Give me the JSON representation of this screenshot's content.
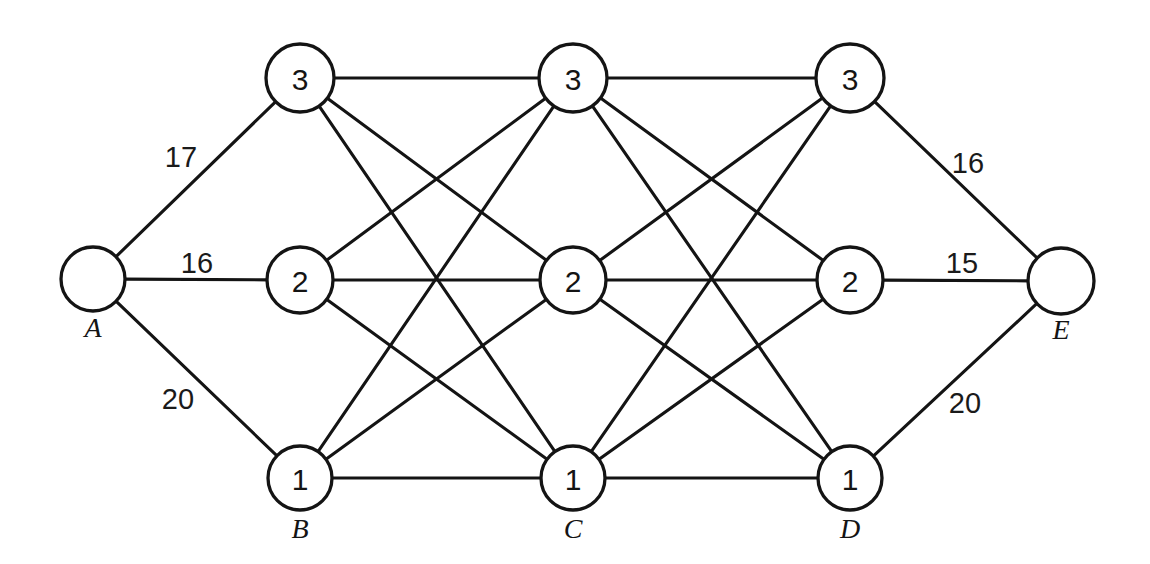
{
  "diagram": {
    "type": "node-link-diagram",
    "background_color": "#ffffff",
    "line_color": "#141414",
    "node_fill": "#ffffff",
    "width": 1150,
    "height": 564
  },
  "nodes": [
    {
      "id": "A",
      "name_label": "A",
      "value_label": "",
      "cx": 93,
      "cy": 279,
      "r": 32,
      "name_dx": 0,
      "name_dy": 48
    },
    {
      "id": "B3",
      "name_label": "",
      "value_label": "3",
      "cx": 300,
      "cy": 78,
      "r": 34,
      "name_dx": 0,
      "name_dy": 0
    },
    {
      "id": "B2",
      "name_label": "",
      "value_label": "2",
      "cx": 300,
      "cy": 280,
      "r": 33,
      "name_dx": 0,
      "name_dy": 0
    },
    {
      "id": "B1",
      "name_label": "B",
      "value_label": "1",
      "cx": 300,
      "cy": 478,
      "r": 32,
      "name_dx": 0,
      "name_dy": 50
    },
    {
      "id": "C3",
      "name_label": "",
      "value_label": "3",
      "cx": 573,
      "cy": 78,
      "r": 34,
      "name_dx": 0,
      "name_dy": 0
    },
    {
      "id": "C2",
      "name_label": "",
      "value_label": "2",
      "cx": 573,
      "cy": 280,
      "r": 33,
      "name_dx": 0,
      "name_dy": 0
    },
    {
      "id": "C1",
      "name_label": "C",
      "value_label": "1",
      "cx": 573,
      "cy": 478,
      "r": 32,
      "name_dx": 0,
      "name_dy": 50
    },
    {
      "id": "D3",
      "name_label": "",
      "value_label": "3",
      "cx": 850,
      "cy": 78,
      "r": 34,
      "name_dx": 0,
      "name_dy": 0
    },
    {
      "id": "D2",
      "name_label": "",
      "value_label": "2",
      "cx": 850,
      "cy": 280,
      "r": 33,
      "name_dx": 0,
      "name_dy": 0
    },
    {
      "id": "D1",
      "name_label": "D",
      "value_label": "1",
      "cx": 850,
      "cy": 478,
      "r": 32,
      "name_dx": 0,
      "name_dy": 50
    },
    {
      "id": "E",
      "name_label": "E",
      "value_label": "",
      "cx": 1061,
      "cy": 281,
      "r": 33,
      "name_dx": 0,
      "name_dy": 48
    }
  ],
  "edges": [
    {
      "from": "A",
      "to": "B3",
      "weight": "17",
      "label_x": 181,
      "label_y": 157
    },
    {
      "from": "A",
      "to": "B2",
      "weight": "16",
      "label_x": 197,
      "label_y": 263
    },
    {
      "from": "A",
      "to": "B1",
      "weight": "20",
      "label_x": 178,
      "label_y": 399
    },
    {
      "from": "B3",
      "to": "C3",
      "weight": "",
      "label_x": 0,
      "label_y": 0
    },
    {
      "from": "B3",
      "to": "C2",
      "weight": "",
      "label_x": 0,
      "label_y": 0
    },
    {
      "from": "B3",
      "to": "C1",
      "weight": "",
      "label_x": 0,
      "label_y": 0
    },
    {
      "from": "B2",
      "to": "C3",
      "weight": "",
      "label_x": 0,
      "label_y": 0
    },
    {
      "from": "B2",
      "to": "C2",
      "weight": "",
      "label_x": 0,
      "label_y": 0
    },
    {
      "from": "B2",
      "to": "C1",
      "weight": "",
      "label_x": 0,
      "label_y": 0
    },
    {
      "from": "B1",
      "to": "C3",
      "weight": "",
      "label_x": 0,
      "label_y": 0
    },
    {
      "from": "B1",
      "to": "C2",
      "weight": "",
      "label_x": 0,
      "label_y": 0
    },
    {
      "from": "B1",
      "to": "C1",
      "weight": "",
      "label_x": 0,
      "label_y": 0
    },
    {
      "from": "C3",
      "to": "D3",
      "weight": "",
      "label_x": 0,
      "label_y": 0
    },
    {
      "from": "C3",
      "to": "D2",
      "weight": "",
      "label_x": 0,
      "label_y": 0
    },
    {
      "from": "C3",
      "to": "D1",
      "weight": "",
      "label_x": 0,
      "label_y": 0
    },
    {
      "from": "C2",
      "to": "D3",
      "weight": "",
      "label_x": 0,
      "label_y": 0
    },
    {
      "from": "C2",
      "to": "D2",
      "weight": "",
      "label_x": 0,
      "label_y": 0
    },
    {
      "from": "C2",
      "to": "D1",
      "weight": "",
      "label_x": 0,
      "label_y": 0
    },
    {
      "from": "C1",
      "to": "D3",
      "weight": "",
      "label_x": 0,
      "label_y": 0
    },
    {
      "from": "C1",
      "to": "D2",
      "weight": "",
      "label_x": 0,
      "label_y": 0
    },
    {
      "from": "C1",
      "to": "D1",
      "weight": "",
      "label_x": 0,
      "label_y": 0
    },
    {
      "from": "D3",
      "to": "E",
      "weight": "16",
      "label_x": 968,
      "label_y": 163
    },
    {
      "from": "D2",
      "to": "E",
      "weight": "15",
      "label_x": 962,
      "label_y": 263
    },
    {
      "from": "D1",
      "to": "E",
      "weight": "20",
      "label_x": 965,
      "label_y": 403
    }
  ]
}
